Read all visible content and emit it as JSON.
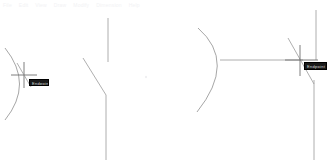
{
  "app": {
    "title": "CAD Drawing Canvas",
    "background_color": "#ffffff",
    "width": 333,
    "height": 165
  },
  "toolbar": {
    "visible_fragments": [
      "File",
      "Edit",
      "View",
      "Draw",
      "Modify",
      "Dimension",
      "Help"
    ],
    "text_color": "#f2f2f4"
  },
  "canvas": {
    "geometry_color": "#8a8a8a",
    "line_color": "#999999",
    "entities": [
      {
        "name": "arc-left",
        "type": "arc",
        "start": [
          5,
          48
        ],
        "mid": [
          26,
          85
        ],
        "end": [
          5,
          120
        ]
      },
      {
        "name": "polyline-middle",
        "type": "polyline",
        "points": [
          [
            108,
            18
          ],
          [
            108,
            62
          ],
          [
            83,
            58
          ],
          [
            106,
            95
          ],
          [
            106,
            160
          ]
        ]
      },
      {
        "name": "arc-right",
        "type": "arc",
        "start": [
          198,
          28
        ],
        "mid": [
          222,
          60
        ],
        "end": [
          197,
          112
        ]
      },
      {
        "name": "line-horizontal-right",
        "type": "line",
        "start": [
          220,
          60
        ],
        "end": [
          302,
          60
        ]
      },
      {
        "name": "line-vertical-far-right",
        "type": "line",
        "start": [
          316,
          10
        ],
        "end": [
          316,
          60
        ]
      },
      {
        "name": "line-vertical-lower-right",
        "type": "line",
        "start": [
          314,
          78
        ],
        "end": [
          314,
          160
        ]
      },
      {
        "name": "line-diagonal-right",
        "type": "line",
        "start": [
          288,
          38
        ],
        "end": [
          314,
          82
        ]
      }
    ]
  },
  "cursors": [
    {
      "name": "crosshair-left",
      "x": 24,
      "y": 75,
      "arm": 13,
      "color": "#606060"
    },
    {
      "name": "crosshair-right",
      "x": 300,
      "y": 60,
      "arm": 15,
      "color": "#606060"
    }
  ],
  "tooltips": {
    "left": {
      "label": "Endpoint",
      "background": "#1a1a1a",
      "text_color": "#d8d8d8"
    },
    "right": {
      "label": "Endpoint",
      "background": "#1a1a1a",
      "text_color": "#d8d8d8"
    }
  },
  "markers": {
    "faint_center_dot": {
      "x": 146,
      "y": 77,
      "color": "#f0f0f2"
    }
  }
}
